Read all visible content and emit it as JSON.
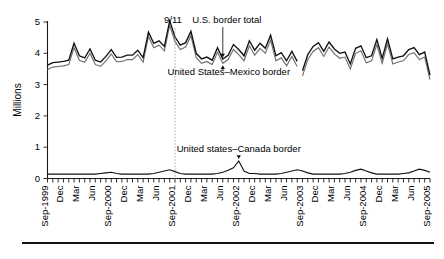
{
  "chart_data": {
    "type": "line",
    "title": "",
    "subtitle": "",
    "xlabel": "",
    "ylabel": "Millions",
    "ylim": [
      0,
      5
    ],
    "yticks": [
      0,
      1,
      2,
      3,
      4,
      5
    ],
    "ytick_labels": [
      "0",
      "1",
      "2",
      "3",
      "4",
      "5"
    ],
    "grid": false,
    "legend_position": "inline-annotations",
    "x_start": "Sep-1999",
    "x_end": "Sep-2005",
    "x_tick_interval": "monthly",
    "x_label_interval": "quarterly",
    "xtick_labels": [
      "Sep-1999",
      "Dec",
      "Mar",
      "Jun",
      "Sep-2000",
      "Dec",
      "Mar",
      "Jun",
      "Sep-2001",
      "Dec",
      "Mar",
      "Jun",
      "Sep-2002",
      "Dec",
      "Mar",
      "Jun",
      "Sep-2003",
      "Dec",
      "Mar",
      "Jun",
      "Sep-2004",
      "Dec",
      "Mar",
      "Jun",
      "Sep-2005"
    ],
    "x": [
      "Sep-1999",
      "Oct-1999",
      "Nov-1999",
      "Dec-1999",
      "Jan-2000",
      "Feb-2000",
      "Mar-2000",
      "Apr-2000",
      "May-2000",
      "Jun-2000",
      "Jul-2000",
      "Aug-2000",
      "Sep-2000",
      "Oct-2000",
      "Nov-2000",
      "Dec-2000",
      "Jan-2001",
      "Feb-2001",
      "Mar-2001",
      "Apr-2001",
      "May-2001",
      "Jun-2001",
      "Jul-2001",
      "Aug-2001",
      "Sep-2001",
      "Oct-2001",
      "Nov-2001",
      "Dec-2001",
      "Jan-2002",
      "Feb-2002",
      "Mar-2002",
      "Apr-2002",
      "May-2002",
      "Jun-2002",
      "Jul-2002",
      "Aug-2002",
      "Sep-2002",
      "Oct-2002",
      "Nov-2002",
      "Dec-2002",
      "Jan-2003",
      "Feb-2003",
      "Mar-2003",
      "Apr-2003",
      "May-2003",
      "Jun-2003",
      "Jul-2003",
      "Aug-2003",
      "Sep-2003",
      "Oct-2003",
      "Nov-2003",
      "Dec-2003",
      "Jan-2004",
      "Feb-2004",
      "Mar-2004",
      "Apr-2004",
      "May-2004",
      "Jun-2004",
      "Jul-2004",
      "Aug-2004",
      "Sep-2004",
      "Oct-2004",
      "Nov-2004",
      "Dec-2004",
      "Jan-2005",
      "Feb-2005",
      "Mar-2005",
      "Apr-2005",
      "May-2005",
      "Jun-2005",
      "Jul-2005",
      "Aug-2005",
      "Sep-2005"
    ],
    "series": [
      {
        "name": "U.S. border total",
        "color": "#111111",
        "values": [
          3.62,
          3.7,
          3.72,
          3.74,
          3.78,
          4.32,
          3.92,
          3.85,
          4.14,
          3.78,
          3.72,
          3.9,
          4.12,
          3.87,
          3.88,
          3.94,
          3.94,
          4.1,
          3.86,
          4.68,
          4.32,
          4.4,
          4.22,
          5.04,
          4.52,
          4.26,
          4.34,
          4.7,
          4.0,
          3.82,
          3.88,
          3.78,
          4.18,
          3.82,
          3.94,
          4.28,
          4.12,
          3.92,
          4.4,
          4.1,
          4.32,
          4.16,
          4.58,
          3.92,
          4.02,
          3.76,
          4.06,
          3.74,
          3.44,
          3.96,
          4.22,
          4.34,
          4.06,
          4.36,
          4.14,
          4.0,
          4.04,
          3.66,
          4.16,
          4.24,
          3.86,
          3.92,
          4.44,
          3.84,
          4.46,
          3.82,
          3.88,
          3.92,
          4.12,
          4.18,
          3.96,
          4.04,
          3.3
        ]
      },
      {
        "name": "United States–Mexico border",
        "color": "#6f6f6f",
        "values": [
          3.48,
          3.56,
          3.58,
          3.6,
          3.64,
          4.18,
          3.78,
          3.71,
          4.0,
          3.64,
          3.58,
          3.76,
          3.98,
          3.73,
          3.74,
          3.8,
          3.8,
          3.96,
          3.72,
          4.54,
          4.18,
          4.26,
          4.08,
          4.9,
          4.38,
          4.12,
          4.2,
          4.56,
          3.86,
          3.68,
          3.74,
          3.64,
          4.04,
          3.68,
          3.8,
          4.12,
          3.96,
          3.76,
          4.24,
          3.94,
          4.16,
          4.0,
          4.42,
          3.76,
          3.86,
          3.6,
          3.9,
          3.58,
          3.28,
          3.8,
          4.06,
          4.18,
          3.9,
          4.2,
          3.98,
          3.84,
          3.88,
          3.5,
          4.0,
          4.08,
          3.7,
          3.76,
          4.28,
          3.68,
          4.3,
          3.66,
          3.72,
          3.76,
          3.96,
          4.02,
          3.8,
          3.88,
          3.16
        ]
      },
      {
        "name": "United states–Canada border",
        "color": "#111111",
        "values": [
          0.14,
          0.14,
          0.14,
          0.14,
          0.14,
          0.14,
          0.14,
          0.14,
          0.14,
          0.14,
          0.16,
          0.18,
          0.2,
          0.16,
          0.14,
          0.14,
          0.14,
          0.14,
          0.14,
          0.14,
          0.16,
          0.2,
          0.24,
          0.28,
          0.22,
          0.16,
          0.14,
          0.14,
          0.14,
          0.14,
          0.14,
          0.14,
          0.16,
          0.2,
          0.26,
          0.34,
          0.56,
          0.24,
          0.16,
          0.16,
          0.14,
          0.14,
          0.14,
          0.14,
          0.16,
          0.2,
          0.24,
          0.28,
          0.24,
          0.18,
          0.14,
          0.14,
          0.14,
          0.14,
          0.14,
          0.14,
          0.16,
          0.2,
          0.26,
          0.3,
          0.24,
          0.18,
          0.14,
          0.14,
          0.14,
          0.14,
          0.14,
          0.16,
          0.18,
          0.24,
          0.3,
          0.26,
          0.2
        ]
      }
    ],
    "annotations": [
      {
        "id": "event-911",
        "label": "9/11",
        "x": "Sep-2001",
        "type": "vertical-dotted-line"
      },
      {
        "id": "label-total",
        "label": "U.S. border total",
        "x": "Jun-2002",
        "type": "arrow-label"
      },
      {
        "id": "label-mexico",
        "label": "United States–Mexico border",
        "x": "Jun-2002",
        "type": "arrow-label"
      },
      {
        "id": "label-canada",
        "label": "United states–Canada border",
        "x": "Sep-2002",
        "type": "arrow-label"
      }
    ],
    "series_break": {
      "present": true,
      "after": "Aug-2003",
      "note": "gap in plotted lines"
    }
  }
}
